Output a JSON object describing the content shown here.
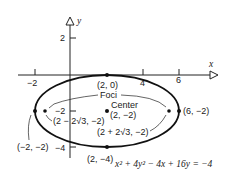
{
  "diagram": {
    "type": "ellipse-graph",
    "axes": {
      "x_label": "x",
      "y_label": "y",
      "x_ticks": [
        {
          "value": -2,
          "label": "−2"
        },
        {
          "value": 4,
          "label": "4"
        },
        {
          "value": 6,
          "label": "6"
        }
      ],
      "y_ticks": [
        {
          "value": 2,
          "label": "2"
        },
        {
          "value": -2,
          "label": "−2"
        },
        {
          "value": -4,
          "label": "−4"
        }
      ]
    },
    "ellipse": {
      "center": [
        2,
        -2
      ],
      "semi_major": 4,
      "semi_minor": 2,
      "equation": "x² + 4y² − 4x + 16y = −4"
    },
    "points": {
      "top_vertex": "(2, 0)",
      "bottom_vertex": "(2, −4)",
      "left_vertex": "(−2, −2)",
      "right_vertex": "(6, −2)",
      "center_label": "Center",
      "center_coords": "(2, −2)",
      "focus_left": "(2 − 2√3, −2)",
      "focus_right": "(2 + 2√3, −2)",
      "foci_label": "Foci"
    },
    "equation_parts": {
      "x": "x",
      "sq": "2",
      "plus4y": " + 4y",
      "minus": " − 4x + 16y = −4"
    },
    "colors": {
      "ink": "#222222",
      "background": "#ffffff"
    }
  }
}
